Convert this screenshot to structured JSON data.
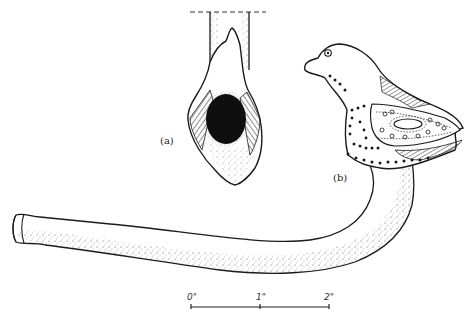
{
  "figure": {
    "label_a": "(a)",
    "label_b": "(b)",
    "scale_bar": {
      "ticks": [
        "0\"",
        "1\"",
        "2\""
      ]
    },
    "colors": {
      "ink": "#1a1a1a",
      "background": "#ffffff",
      "bowl_hole": "#0d0d0d"
    }
  }
}
